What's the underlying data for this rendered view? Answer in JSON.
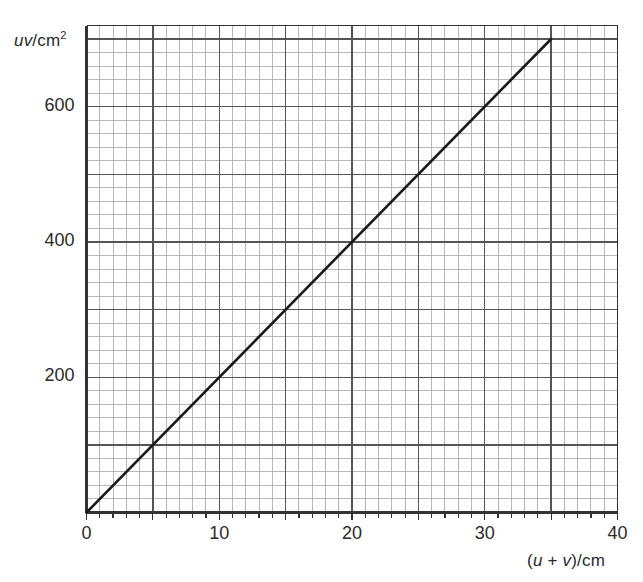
{
  "chart_data": {
    "type": "line",
    "title": "",
    "subtitle": "",
    "xlabel": "(u + v)/cm",
    "ylabel": "uv/cm2",
    "xlabel_parts": {
      "open": "(",
      "u": "u",
      "plus": " + ",
      "v": "v",
      "close": ")/cm"
    },
    "ylabel_parts": {
      "uv": "uv",
      "unit": "/cm",
      "exponent": "2"
    },
    "xlim": [
      0,
      40
    ],
    "ylim": [
      0,
      720
    ],
    "x_major_step": 5,
    "x_minor_step": 1,
    "y_major_step": 100,
    "y_minor_step": 20,
    "grid": true,
    "grid_major_color": "#555555",
    "grid_minor_color": "#b0b0b0",
    "axis_color": "#333333",
    "line_color": "#1a1a1a",
    "legend": null,
    "xticks": [
      {
        "value": 0,
        "label": "0"
      },
      {
        "value": 10,
        "label": "10"
      },
      {
        "value": 20,
        "label": "20"
      },
      {
        "value": 30,
        "label": "30"
      },
      {
        "value": 40,
        "label": "40"
      }
    ],
    "yticks": [
      {
        "value": 200,
        "label": "200"
      },
      {
        "value": 400,
        "label": "400"
      },
      {
        "value": 600,
        "label": "600"
      }
    ],
    "series": [
      {
        "name": "uv vs (u + v)",
        "type": "line",
        "points": [
          {
            "x": 0,
            "y": 0
          },
          {
            "x": 35,
            "y": 700
          }
        ],
        "slope": 20,
        "intercept": 0
      }
    ],
    "annotations": []
  }
}
